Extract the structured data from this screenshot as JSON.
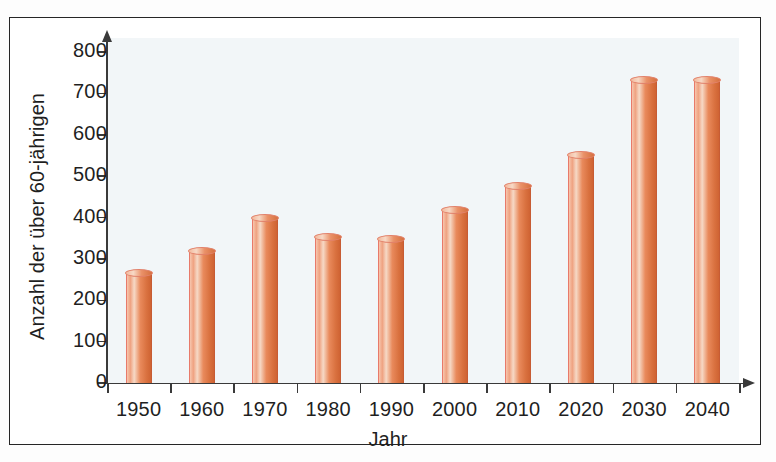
{
  "chart_data": {
    "type": "bar",
    "title": "",
    "xlabel": "Jahr",
    "ylabel": "Anzahl der über 60-jährigen",
    "categories": [
      "1950",
      "1960",
      "1970",
      "1980",
      "1990",
      "2000",
      "2010",
      "2020",
      "2030",
      "2040"
    ],
    "values": [
      265,
      320,
      398,
      353,
      347,
      418,
      475,
      552,
      733,
      733
    ],
    "ylim": [
      0,
      800
    ],
    "ytick_labels": [
      "0",
      "100",
      "200",
      "300",
      "400",
      "500",
      "600",
      "700",
      "800"
    ],
    "ytick_values": [
      0,
      100,
      200,
      300,
      400,
      500,
      600,
      700,
      800
    ],
    "ytick_step": 100,
    "grid": false,
    "legend": "none",
    "bar_style": "3d-cylinder",
    "colors": {
      "bar_light": "#f6d9c6",
      "bar_mid": "#e98a5c",
      "bar_dark": "#cf6333",
      "bar_outline": "#e2826b",
      "axis": "#3a3a3a",
      "text": "#1f1f1f",
      "plot_background": "#eef3f6",
      "frame": "#262626",
      "page_background": "#ffffff"
    }
  }
}
